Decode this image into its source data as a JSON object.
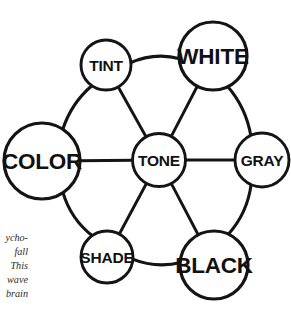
{
  "figure": {
    "background_color": "#ffffff",
    "stroke_color": "#141414",
    "text_color": "#111111"
  },
  "diagram": {
    "type": "node-link-wheel",
    "hub": "TONE",
    "nodes": [
      {
        "id": "tint",
        "label": "TINT",
        "cx": 106,
        "cy": 65,
        "r": 25,
        "font_size": 15.5
      },
      {
        "id": "white",
        "label": "WHITE",
        "cx": 213,
        "cy": 56,
        "r": 34,
        "font_size": 22.5
      },
      {
        "id": "color",
        "label": "COLOR",
        "cx": 42,
        "cy": 161,
        "r": 38,
        "font_size": 22.5
      },
      {
        "id": "tone",
        "label": "TONE",
        "cx": 159,
        "cy": 160,
        "r": 26.5,
        "font_size": 15.5
      },
      {
        "id": "gray",
        "label": "GRAY",
        "cx": 262,
        "cy": 160,
        "r": 27,
        "font_size": 15.5
      },
      {
        "id": "shade",
        "label": "SHADE",
        "cx": 107,
        "cy": 257,
        "r": 26,
        "font_size": 15.5
      },
      {
        "id": "black",
        "label": "BLACK",
        "cx": 214,
        "cy": 265,
        "r": 34,
        "font_size": 22.5
      }
    ],
    "ring_edges": [
      {
        "from": "tint",
        "to": "white",
        "curve": -9
      },
      {
        "from": "white",
        "to": "gray",
        "curve": -8
      },
      {
        "from": "gray",
        "to": "black",
        "curve": -9
      },
      {
        "from": "black",
        "to": "shade",
        "curve": -8
      },
      {
        "from": "shade",
        "to": "color",
        "curve": -9
      },
      {
        "from": "color",
        "to": "tint",
        "curve": -8
      }
    ],
    "spoke_edges": [
      {
        "from": "tone",
        "to": "tint",
        "curve": 0
      },
      {
        "from": "tone",
        "to": "white",
        "curve": 0
      },
      {
        "from": "tone",
        "to": "color",
        "curve": 0
      },
      {
        "from": "tone",
        "to": "gray",
        "curve": 0
      },
      {
        "from": "tone",
        "to": "shade",
        "curve": 0
      },
      {
        "from": "tone",
        "to": "black",
        "curve": 0
      }
    ]
  },
  "caption": {
    "lines": [
      "ycho-",
      "fall",
      "This",
      "wave",
      "brain"
    ]
  }
}
